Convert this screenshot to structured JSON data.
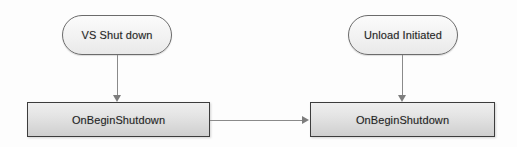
{
  "diagram": {
    "nodes": [
      {
        "id": "pill-vs-shutdown",
        "shape": "rounded-pill",
        "label": "VS Shut down"
      },
      {
        "id": "pill-unload-initiated",
        "shape": "rounded-pill",
        "label": "Unload Initiated"
      },
      {
        "id": "box-left-onbeginshutdown",
        "shape": "rectangle",
        "label": "OnBeginShutdown"
      },
      {
        "id": "box-right-onbeginshutdown",
        "shape": "rectangle",
        "label": "OnBeginShutdown"
      }
    ],
    "edges": [
      {
        "id": "conn-left",
        "from": "pill-vs-shutdown",
        "to": "box-left-onbeginshutdown",
        "direction": "down",
        "arrowhead": "filled-triangle"
      },
      {
        "id": "conn-right",
        "from": "pill-unload-initiated",
        "to": "box-right-onbeginshutdown",
        "direction": "down",
        "arrowhead": "filled-triangle"
      },
      {
        "id": "conn-mid",
        "from": "box-left-onbeginshutdown",
        "to": "box-right-onbeginshutdown",
        "direction": "right",
        "arrowhead": "filled-triangle"
      }
    ],
    "colors": {
      "background": "#fdfdfd",
      "pill_border": "#6b6b6b",
      "pill_fill": "#f2f2f2",
      "box_border": "#3d3d3d",
      "box_fill": "#e4e4e4",
      "connector": "#8a8a8a",
      "text": "#1f1f1f"
    }
  }
}
